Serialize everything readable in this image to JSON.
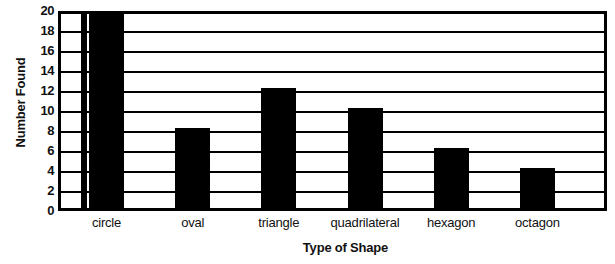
{
  "chart_data": {
    "type": "bar",
    "title": "",
    "xlabel": "Type of Shape",
    "ylabel": "Number Found",
    "categories": [
      "circle",
      "oval",
      "triangle",
      "quadrilateral",
      "hexagon",
      "octagon"
    ],
    "values": [
      20,
      8,
      12,
      10,
      6,
      4
    ],
    "ylim": [
      0,
      20
    ],
    "ytick_step": 2,
    "yticks": [
      20,
      18,
      16,
      14,
      12,
      10,
      8,
      6,
      4,
      2,
      0
    ],
    "ytick_labels": [
      "20",
      "18",
      "16",
      "14",
      "12",
      "10",
      "8",
      "6",
      "4",
      "2",
      "0"
    ],
    "grid": true,
    "grid_orientation": "horizontal",
    "legend": false,
    "legend_position": "none",
    "bar_color": "#000000",
    "plot_background": "#ffffff",
    "axis_color": "#000000"
  },
  "axis": {
    "y_title": "Number Found",
    "x_title": "Type of Shape"
  }
}
